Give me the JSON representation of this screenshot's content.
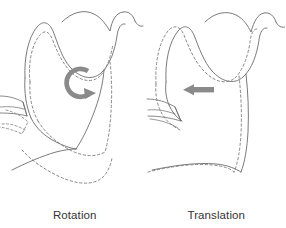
{
  "figure": {
    "background_color": "#ffffff",
    "panels": [
      {
        "id": "rotation",
        "caption": "Rotation",
        "arrow": {
          "name": "rotation-arrow",
          "kind": "curved-circular-arrow",
          "direction": "clockwise",
          "color": "#8a8a8a",
          "center_x": 80,
          "center_y": 83,
          "radius": 14
        },
        "outlines": {
          "solid_label": "mandible at rest (solid outline)",
          "dashed_label": "mandible after movement (dashed outline)",
          "stroke_color": "#6b6b6b",
          "dash_color": "#7a7a7a"
        }
      },
      {
        "id": "translation",
        "caption": "Translation",
        "arrow": {
          "name": "translation-arrow",
          "kind": "straight-arrow",
          "direction": "left",
          "color": "#8a8a8a",
          "tail_x": 212,
          "tip_x": 184,
          "y": 90
        },
        "outlines": {
          "solid_label": "mandible at rest (solid outline)",
          "dashed_label": "mandible after movement (dashed outline)",
          "stroke_color": "#6b6b6b",
          "dash_color": "#7a7a7a"
        }
      }
    ],
    "legend": {
      "solid": "Solid line: original position",
      "dashed": "Dashed line: displaced position"
    },
    "colors": {
      "outline": "#6b6b6b",
      "dashed_outline": "#7d7d7d",
      "arrow_gray": "#8a8a8a",
      "caption_text": "#333333",
      "background": "#ffffff"
    }
  }
}
